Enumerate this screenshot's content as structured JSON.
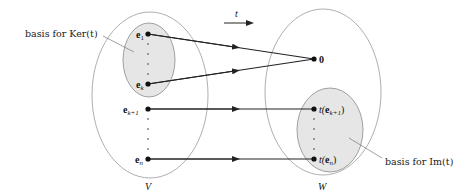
{
  "diagram": {
    "arrow_label": "t",
    "domain_label": "V",
    "codomain_label": "W",
    "zero_label": "0",
    "kernel_callout": "basis for Ker(t)",
    "image_callout": "basis for Im(t)",
    "domain_vectors": [
      {
        "base": "e",
        "sub": "1"
      },
      {
        "base": "e",
        "sub": "k"
      },
      {
        "base": "e",
        "sub": "k+1"
      },
      {
        "base": "e",
        "sub": "n"
      }
    ],
    "image_vectors": [
      {
        "prefix": "t(",
        "base": "e",
        "sub": "k+1",
        "suffix": ")"
      },
      {
        "prefix": "t(",
        "base": "e",
        "sub": "n",
        "suffix": ")"
      }
    ],
    "colors": {
      "outer_ellipse_stroke": "#9a9a9a",
      "inner_ellipse_fill": "#e6e6e6",
      "inner_ellipse_stroke": "#8a8a8a",
      "arrow": "#222222"
    }
  }
}
